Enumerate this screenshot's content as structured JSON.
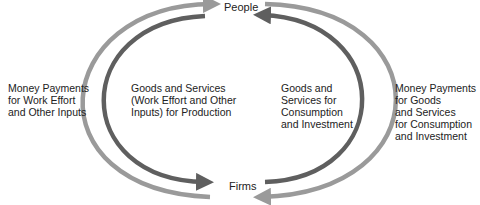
{
  "diagram": {
    "nodes": {
      "top": "People",
      "bottom": "Firms"
    },
    "flows": {
      "outer_left": "Money Payments\nfor Work Effort\nand Other Inputs",
      "inner_left": "Goods and Services\n(Work Effort and Other\nInputs) for Production",
      "inner_right": "Goods and\nServices for\nConsumption\nand Investment",
      "outer_right": "Money Payments\nfor Goods\nand Services\nfor Consumption\nand Investment"
    },
    "colors": {
      "light_arrow": "#9a9a9a",
      "dark_arrow": "#5f5f5f",
      "text": "#222222"
    }
  }
}
